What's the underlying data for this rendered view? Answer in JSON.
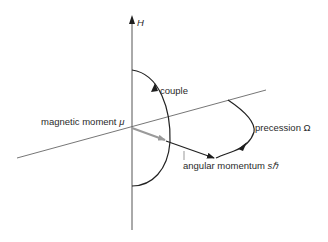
{
  "diagram": {
    "axis_label": "H",
    "labels": {
      "couple": "couple",
      "magnetic_moment": "magnetic moment",
      "magnetic_moment_symbol": "μ",
      "angular_momentum": "angular momentum",
      "angular_momentum_symbol": "sℏ",
      "precession": "precession",
      "precession_symbol": "Ω"
    },
    "colors": {
      "line": "#555555",
      "curve": "#222222",
      "moment_arrow": "#9a9a9a",
      "background": "#ffffff"
    }
  }
}
